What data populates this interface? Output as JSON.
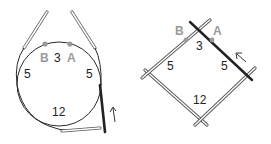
{
  "diagrams": [
    {
      "name": "circular-needle-diagram",
      "labels": {
        "marker_b": "B",
        "marker_a": "A",
        "top": "3",
        "left": "5",
        "right": "5",
        "bottom": "12"
      },
      "direction_arrow": "up",
      "icon": "arrow-up-icon"
    },
    {
      "name": "double-pointed-needles-diagram",
      "labels": {
        "marker_b": "B",
        "marker_a": "A",
        "top": "3",
        "left": "5",
        "right": "5",
        "bottom": "12"
      },
      "direction_arrow": "up-left",
      "icon": "arrow-up-left-icon"
    }
  ],
  "colors": {
    "line": "#2a2a2a",
    "marker": "#9a9a9a",
    "needle_outline": "#555555",
    "needle_fill": "#ffffff",
    "active_needle": "#222222"
  }
}
